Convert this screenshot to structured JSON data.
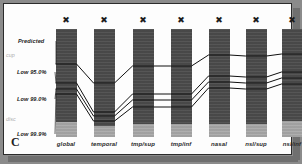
{
  "figure": {
    "panel_letter": "C",
    "background_color": "#8b8b8b",
    "card_color": "#fdfdfd"
  },
  "side_labels": [
    {
      "text": "cup",
      "y": 48
    },
    {
      "text": "disc",
      "y": 112
    }
  ],
  "annotations": [
    {
      "text": "Predicted",
      "label_x": 14,
      "label_y": 34,
      "target_x": 62,
      "target_y": 60
    },
    {
      "text": "Low 95.0%",
      "label_x": 13,
      "label_y": 65,
      "target_x": 62,
      "target_y": 79
    },
    {
      "text": "Low 99.0%",
      "label_x": 13,
      "label_y": 92,
      "target_x": 62,
      "target_y": 85
    },
    {
      "text": "Low 99.9%",
      "label_x": 13,
      "label_y": 127,
      "target_x": 62,
      "target_y": 90
    }
  ],
  "marker_glyph": "✖",
  "chart_data": {
    "type": "bar",
    "title": "",
    "xlabel": "",
    "ylabel": "",
    "grid": false,
    "legend": "none",
    "series_names": [
      "Predicted",
      "Low 95.0%",
      "Low 99.0%",
      "Low 99.9%"
    ],
    "categories": [
      "global",
      "temporal",
      "tmp/sup",
      "tmp/inf",
      "nasal",
      "nsl/sup",
      "nsl/inf"
    ],
    "marker_row": [
      "✖",
      "✖",
      "✖",
      "✖",
      "✖",
      "✖",
      "✖"
    ],
    "columns": [
      {
        "category": "global",
        "x": 62,
        "width": 21,
        "top": 25,
        "bottom": 133,
        "light_start": 118,
        "lines": {
          "Predicted": 60,
          "Low 95.0%": 79,
          "Low 99.0%": 85,
          "Low 99.9%": 90
        }
      },
      {
        "category": "temporal",
        "x": 100,
        "width": 21,
        "top": 25,
        "bottom": 133,
        "light_start": 122,
        "lines": {
          "Predicted": 79,
          "Low 95.0%": 108,
          "Low 99.0%": 112,
          "Low 99.9%": 117
        }
      },
      {
        "category": "tmp/sup",
        "x": 139,
        "width": 21,
        "top": 25,
        "bottom": 133,
        "light_start": 120,
        "lines": {
          "Predicted": 62,
          "Low 95.0%": 90,
          "Low 99.0%": 96,
          "Low 99.9%": 103
        }
      },
      {
        "category": "tmp/inf",
        "x": 177,
        "width": 21,
        "top": 25,
        "bottom": 133,
        "light_start": 120,
        "lines": {
          "Predicted": 62,
          "Low 95.0%": 90,
          "Low 99.0%": 96,
          "Low 99.9%": 103
        }
      },
      {
        "category": "nasal",
        "x": 215,
        "width": 21,
        "top": 25,
        "bottom": 133,
        "light_start": 120,
        "lines": {
          "Predicted": 51,
          "Low 95.0%": 72,
          "Low 99.0%": 78,
          "Low 99.9%": 84
        }
      },
      {
        "category": "nsl/sup",
        "x": 252,
        "width": 21,
        "top": 25,
        "bottom": 133,
        "light_start": 120,
        "lines": {
          "Predicted": 52,
          "Low 95.0%": 73,
          "Low 99.0%": 79,
          "Low 99.9%": 85
        }
      },
      {
        "category": "nsl/inf",
        "x": 288,
        "width": 21,
        "top": 25,
        "bottom": 133,
        "light_start": 117,
        "lines": {
          "Predicted": 50,
          "Low 95.0%": 68,
          "Low 99.0%": 74,
          "Low 99.9%": 80
        }
      }
    ],
    "colors": {
      "bar_dark": "#4c4c4c",
      "bar_light": "#a9a9a9",
      "line": "#111111"
    }
  }
}
